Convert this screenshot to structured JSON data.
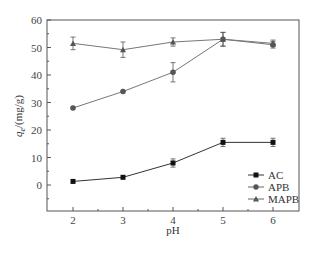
{
  "chart_data": {
    "type": "line",
    "title": "",
    "xlabel": "pH",
    "ylabel": "q_e/(mg/g)",
    "ylabel_main": "q",
    "ylabel_sub": "e",
    "ylabel_rest": "/(mg/g)",
    "x": [
      2,
      3,
      4,
      5,
      6
    ],
    "xticks": [
      "2",
      "3",
      "4",
      "5",
      "6"
    ],
    "yticks": [
      "0",
      "10",
      "20",
      "30",
      "40",
      "50",
      "60"
    ],
    "xlim": [
      1.5,
      6.5
    ],
    "ylim": [
      -9,
      60
    ],
    "grid": false,
    "legend_position": "lower right",
    "series": [
      {
        "name": "AC",
        "marker": "square",
        "values": [
          1.3,
          2.8,
          8.0,
          15.5,
          15.5
        ],
        "errors": [
          0,
          0,
          1.5,
          1.5,
          1.5
        ]
      },
      {
        "name": "APB",
        "marker": "circle",
        "values": [
          28.0,
          34.0,
          41.0,
          53.0,
          51.0
        ],
        "errors": [
          0,
          0,
          3.5,
          2.5,
          1.2
        ]
      },
      {
        "name": "MAPB",
        "marker": "triangle",
        "values": [
          51.5,
          49.2,
          52.0,
          53.0,
          51.5
        ],
        "errors": [
          2.3,
          2.8,
          1.5,
          2.5,
          1.2
        ]
      }
    ]
  },
  "legend": {
    "items": [
      {
        "label": "AC"
      },
      {
        "label": "APB"
      },
      {
        "label": "MAPB"
      }
    ]
  }
}
